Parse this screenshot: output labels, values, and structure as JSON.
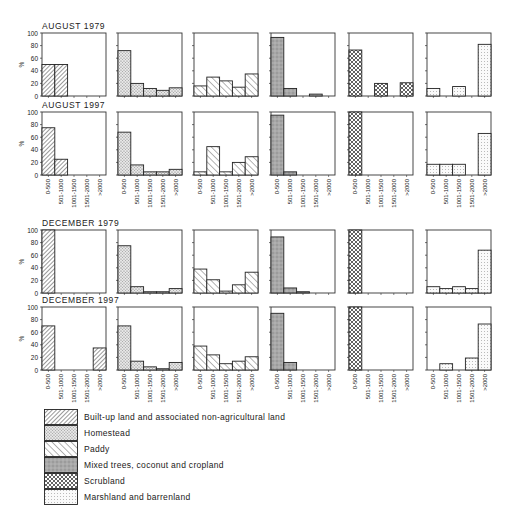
{
  "chart_data": {
    "type": "bar",
    "ylabel": "%",
    "ylim": [
      0,
      100
    ],
    "yticks": [
      0,
      20,
      40,
      60,
      80,
      100
    ],
    "categories": [
      "0-500",
      "501-1000",
      "1001-1500",
      "1501-2000",
      ">2000"
    ],
    "series_names": [
      "Built-up land and associated non-agricultural land",
      "Homestead",
      "Paddy",
      "Mixed trees, coconut and cropland",
      "Scrubland",
      "Marshland and barrenland"
    ],
    "panels": [
      {
        "period": "AUGUST 1979",
        "series": [
          {
            "name": "Built-up land and associated non-agricultural land",
            "values": [
              50,
              50,
              0,
              0,
              0
            ]
          },
          {
            "name": "Homestead",
            "values": [
              72,
              20,
              12,
              9,
              13
            ]
          },
          {
            "name": "Paddy",
            "values": [
              16,
              30,
              24,
              14,
              35
            ]
          },
          {
            "name": "Mixed trees, coconut and cropland",
            "values": [
              93,
              12,
              0,
              3,
              0
            ]
          },
          {
            "name": "Scrubland",
            "values": [
              73,
              0,
              20,
              0,
              21
            ]
          },
          {
            "name": "Marshland and barrenland",
            "values": [
              12,
              0,
              15,
              0,
              82
            ]
          }
        ]
      },
      {
        "period": "AUGUST 1997",
        "series": [
          {
            "name": "Built-up land and associated non-agricultural land",
            "values": [
              75,
              25,
              0,
              0,
              0
            ]
          },
          {
            "name": "Homestead",
            "values": [
              68,
              16,
              5,
              5,
              9
            ]
          },
          {
            "name": "Paddy",
            "values": [
              5,
              45,
              5,
              20,
              29
            ]
          },
          {
            "name": "Mixed trees, coconut and cropland",
            "values": [
              95,
              5,
              0,
              0,
              0
            ]
          },
          {
            "name": "Scrubland",
            "values": [
              100,
              0,
              0,
              0,
              0
            ]
          },
          {
            "name": "Marshland and barrenland",
            "values": [
              17,
              17,
              17,
              0,
              66
            ]
          }
        ]
      },
      {
        "period": "DECEMBER 1979",
        "series": [
          {
            "name": "Built-up land and associated non-agricultural land",
            "values": [
              100,
              0,
              0,
              0,
              0
            ]
          },
          {
            "name": "Homestead",
            "values": [
              75,
              10,
              2,
              2,
              7
            ]
          },
          {
            "name": "Paddy",
            "values": [
              38,
              21,
              3,
              13,
              33
            ]
          },
          {
            "name": "Mixed trees, coconut and cropland",
            "values": [
              89,
              8,
              2,
              0,
              0
            ]
          },
          {
            "name": "Scrubland",
            "values": [
              100,
              0,
              0,
              0,
              0
            ]
          },
          {
            "name": "Marshland and barrenland",
            "values": [
              10,
              7,
              10,
              7,
              68
            ]
          }
        ]
      },
      {
        "period": "DECEMBER 1997",
        "series": [
          {
            "name": "Built-up land and associated non-agricultural land",
            "values": [
              70,
              0,
              0,
              0,
              35
            ]
          },
          {
            "name": "Homestead",
            "values": [
              70,
              14,
              5,
              2,
              12
            ]
          },
          {
            "name": "Paddy",
            "values": [
              38,
              24,
              10,
              14,
              21
            ]
          },
          {
            "name": "Mixed trees, coconut and cropland",
            "values": [
              90,
              12,
              0,
              0,
              0
            ]
          },
          {
            "name": "Scrubland",
            "values": [
              100,
              0,
              0,
              0,
              0
            ]
          },
          {
            "name": "Marshland and barrenland",
            "values": [
              0,
              10,
              0,
              19,
              73
            ]
          }
        ]
      }
    ],
    "legend_position": "bottom-left",
    "grid": false
  },
  "legend": {
    "items": [
      {
        "label": "Built-up land and associated non-agricultural land",
        "pattern": "diag-dense"
      },
      {
        "label": "Homestead",
        "pattern": "stipple"
      },
      {
        "label": "Paddy",
        "pattern": "diag-wide"
      },
      {
        "label": "Mixed trees, coconut and cropland",
        "pattern": "gray-shade"
      },
      {
        "label": "Scrubland",
        "pattern": "crosshatch"
      },
      {
        "label": "Marshland and barrenland",
        "pattern": "dots"
      }
    ]
  }
}
